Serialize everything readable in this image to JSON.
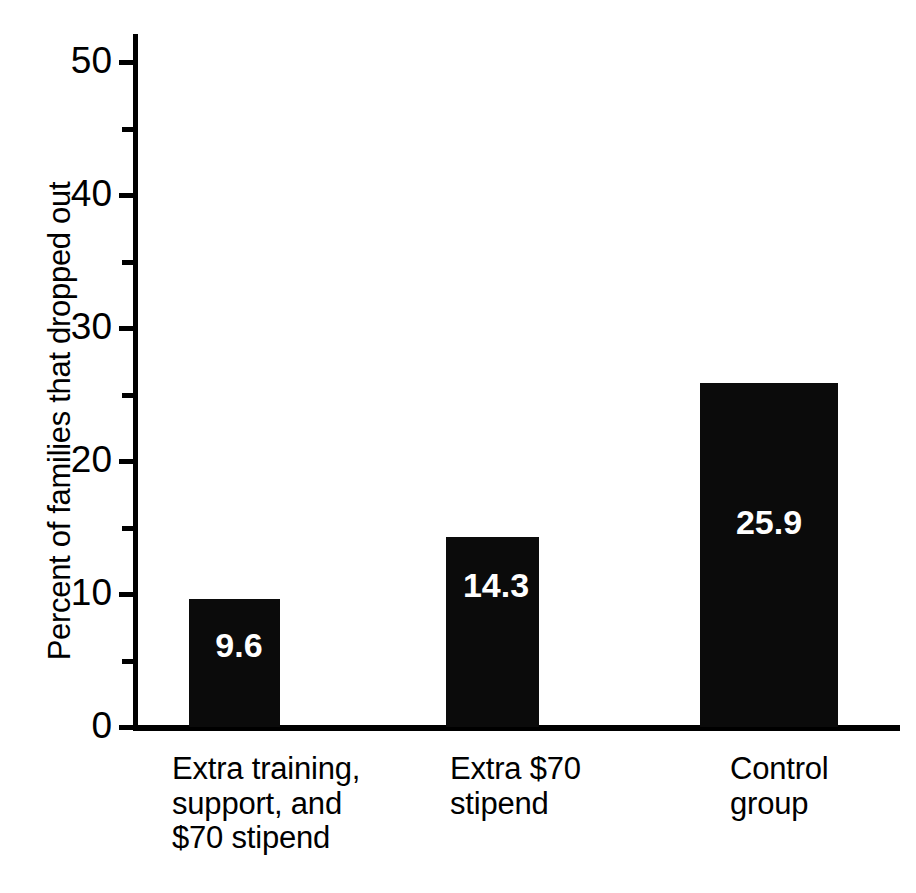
{
  "chart_data": {
    "type": "bar",
    "title": "",
    "subtitle": "",
    "xlabel": "",
    "ylabel": "Percent of families that dropped out",
    "categories": [
      "Extra training, support, and $70 stipend",
      "Extra $70 stipend",
      "Control group"
    ],
    "category_lines": [
      [
        "Extra training,",
        "support, and",
        "$70 stipend"
      ],
      [
        "Extra $70",
        "stipend"
      ],
      [
        "Control",
        "group"
      ]
    ],
    "values": [
      9.6,
      14.3,
      25.9
    ],
    "value_labels": [
      "9.6",
      "14.3",
      "25.9"
    ],
    "ylim": [
      0,
      50
    ],
    "y_major_ticks": [
      0,
      10,
      20,
      30,
      40,
      50
    ],
    "y_major_tick_labels": [
      "0",
      "10",
      "20",
      "30",
      "40",
      "50"
    ],
    "y_minor_ticks": [
      5,
      15,
      25,
      35,
      45
    ],
    "grid": false,
    "legend": null,
    "legend_position": "none",
    "bar_color": "#0b0b0b",
    "value_label_color": "#ffffff",
    "axis_color": "#000000",
    "background_color": "#ffffff"
  }
}
